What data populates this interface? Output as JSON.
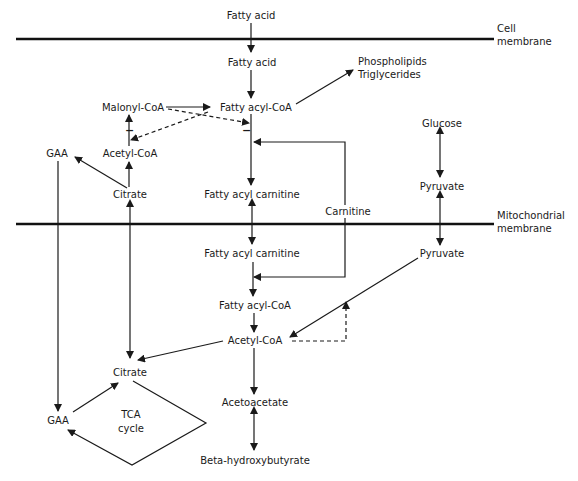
{
  "diagram": {
    "membranes": {
      "cell": {
        "line1": "Cell",
        "line2": "membrane"
      },
      "mito": {
        "line1": "Mitochondrial",
        "line2": "membrane"
      }
    },
    "nodes": {
      "fatty_acid_outside": "Fatty acid",
      "fatty_acid_cytosol": "Fatty acid",
      "phospholipids": "Phospholipids",
      "triglycerides": "Triglycerides",
      "malonyl_coa": "Malonyl-CoA",
      "fatty_acyl_coa_cytosol": "Fatty acyl-CoA",
      "acetyl_coa_cytosol": "Acetyl-CoA",
      "gaa_top": "GAA",
      "citrate_cytosol": "Citrate",
      "fatty_acyl_carnitine_cytosol": "Fatty acyl carnitine",
      "carnitine": "Carnitine",
      "glucose": "Glucose",
      "pyruvate_cytosol": "Pyruvate",
      "fatty_acyl_carnitine_mito": "Fatty acyl carnitine",
      "pyruvate_mito": "Pyruvate",
      "fatty_acyl_coa_mito": "Fatty acyl-CoA",
      "acetyl_coa_mito": "Acetyl-CoA",
      "citrate_mito": "Citrate",
      "tca_line1": "TCA",
      "tca_line2": "cycle",
      "gaa_bottom": "GAA",
      "acetoacetate": "Acetoacetate",
      "beta_hydroxybutyrate": "Beta-hydroxybutyrate"
    },
    "inhibition_marks": {
      "malonyl_on_cpt": "−",
      "acyl_coa_on_acc": "−"
    },
    "colors": {
      "ink": "#1a1a1a",
      "background": "#ffffff"
    }
  }
}
